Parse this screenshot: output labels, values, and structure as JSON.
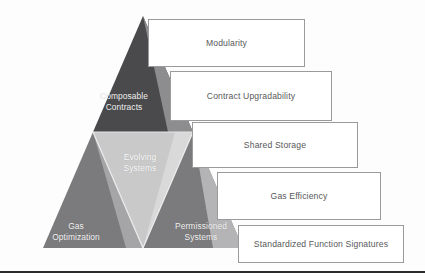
{
  "diagram": {
    "background_color": "#fdfdfd",
    "pyramid": {
      "apex_label": "",
      "tiers": [
        {
          "id": "composable-contracts",
          "label": "Composable\nContracts",
          "fill": "#4a4a4c",
          "shade": "#8f8f91",
          "position": "top"
        },
        {
          "id": "evolving-systems",
          "label": "Evolving\nSystems",
          "fill": "#c9c9c9",
          "shade": "#e2e2e2",
          "position": "center-inverted"
        },
        {
          "id": "gas-optimization",
          "label": "Gas\nOptimization",
          "fill": "#7b7b7d",
          "shade": "#a2a2a4",
          "position": "bottom-left"
        },
        {
          "id": "permissioned-systems",
          "label": "Permissioned\nSystems",
          "fill": "#7b7b7d",
          "shade": "#b3b3b5",
          "position": "bottom-right"
        }
      ]
    },
    "callouts": [
      {
        "id": "callout-modularity",
        "label": "Modularity"
      },
      {
        "id": "callout-contract-upgradability",
        "label": "Contract Upgradability"
      },
      {
        "id": "callout-shared-storage",
        "label": "Shared Storage"
      },
      {
        "id": "callout-gas-efficiency",
        "label": "Gas Efficiency"
      },
      {
        "id": "callout-standardized-signatures",
        "label": "Standardized Function Signatures"
      }
    ],
    "callout_border_color": "#9a9a9a",
    "callout_text_color": "#58585a",
    "label_text_color": "#f2f2f2",
    "bottom_rule_color": "#2b2b2e"
  }
}
